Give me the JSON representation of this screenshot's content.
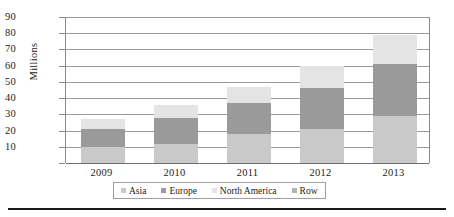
{
  "chart_data": {
    "type": "bar",
    "subtype": "stacked-column",
    "title": "",
    "xlabel": "",
    "ylabel": "Millions",
    "categories": [
      "2009",
      "2010",
      "2011",
      "2012",
      "2013"
    ],
    "series": [
      {
        "name": "Asia",
        "color": "#c9c9c9",
        "values": [
          10,
          12,
          18,
          21,
          29
        ]
      },
      {
        "name": "Europe",
        "color": "#9a9a9a",
        "values": [
          11,
          16,
          19,
          25,
          32
        ]
      },
      {
        "name": "North America",
        "color": "#e4e4e4",
        "values": [
          6,
          8,
          10,
          14,
          18
        ]
      },
      {
        "name": "Row",
        "color": "#b4b4b4",
        "values": [
          0,
          0,
          0,
          0,
          0
        ]
      }
    ],
    "totals": [
      27,
      36,
      47,
      60,
      79
    ],
    "yticks": [
      0,
      10,
      20,
      30,
      40,
      50,
      60,
      70,
      80,
      90
    ],
    "ytick_labels": [
      "",
      "10",
      "20",
      "30",
      "40",
      "50",
      "60",
      "70",
      "80",
      "90"
    ],
    "ylim": [
      0,
      90
    ],
    "grid": true,
    "legend_position": "bottom",
    "legend_entries": [
      "Asia",
      "Europe",
      "North America",
      "Row"
    ]
  },
  "axis": {
    "y_title": "Millions"
  }
}
